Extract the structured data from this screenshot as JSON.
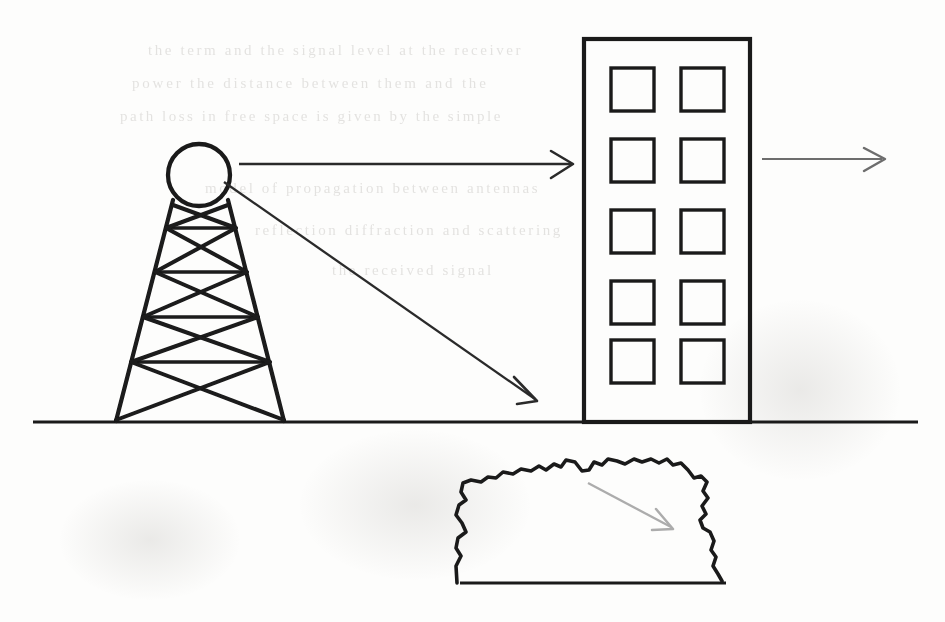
{
  "figure": {
    "kind": "line-diagram",
    "background_color": "#fdfdfc",
    "ink_color": "#1a1a1a",
    "faint_ink_color": "#9d9d9d",
    "ghost_text_color": "#cfcdca"
  },
  "ground": {
    "label": "ground-line",
    "x1": 33,
    "y1": 422,
    "x2": 918,
    "y2": 422,
    "stroke_width": 3.2
  },
  "tower": {
    "label": "transmitter-tower",
    "base_left_x": 115,
    "base_right_x": 285,
    "top_left_x": 173,
    "top_right_x": 228,
    "top_y": 203,
    "base_y": 421,
    "stroke_width": 4.0,
    "bracing_levels": 5,
    "antenna": {
      "label": "antenna-dish",
      "shape": "circle",
      "cx": 199,
      "cy": 175,
      "r": 31,
      "stroke_width": 4.2
    }
  },
  "building": {
    "label": "receiver-building",
    "x": 584,
    "y": 39,
    "width": 166,
    "height": 383,
    "stroke_width": 4.0,
    "window_rows": 5,
    "window_cols": 2,
    "window_size": 43,
    "window_stroke_width": 3.4,
    "window_col_x": [
      611,
      681
    ],
    "window_row_y": [
      68,
      139,
      210,
      281,
      340
    ]
  },
  "arrows": [
    {
      "name": "direct-path-arrow",
      "description": "horizontal ray from antenna to building",
      "x1": 239,
      "y1": 164,
      "x2": 573,
      "y2": 164,
      "color": "#2a2a2a",
      "stroke_width": 2.2,
      "head": "open-v"
    },
    {
      "name": "reflected-path-arrow",
      "description": "diagonal ray from antenna down to ground",
      "x1": 225,
      "y1": 183,
      "x2": 537,
      "y2": 401,
      "color": "#2a2a2a",
      "stroke_width": 2.2,
      "head": "open-v"
    },
    {
      "name": "transmitted-path-arrow",
      "description": "short ray continuing past the building",
      "x1": 762,
      "y1": 159,
      "x2": 886,
      "y2": 159,
      "color": "#6d6d6d",
      "stroke_width": 2.0,
      "head": "open-v"
    },
    {
      "name": "terrain-scatter-arrow",
      "description": "faint grey ray inside the terrain obstacle",
      "x1": 588,
      "y1": 483,
      "x2": 674,
      "y2": 529,
      "color": "#a9a9a9",
      "stroke_width": 2.2,
      "head": "open-v"
    }
  ],
  "terrain": {
    "label": "terrain-obstacle",
    "description": "rough irregular hill outline with flat base",
    "left_x": 455,
    "right_x": 726,
    "base_y": 583,
    "peak_y": 459,
    "stroke_width": 3.6
  },
  "ghost_text": {
    "description": "faint bleed-through text from the reverse side of the scanned page",
    "lines": [
      {
        "text": "the  term  and  the  signal  level  at  the  receiver",
        "x": 148,
        "y": 42,
        "size": 15,
        "spacing": 2.6
      },
      {
        "text": "power  the  distance  between  them  and  the",
        "x": 132,
        "y": 75,
        "size": 15,
        "spacing": 2.8
      },
      {
        "text": "path  loss  in  free  space  is  given  by  the  simple",
        "x": 120,
        "y": 108,
        "size": 15,
        "spacing": 2.5
      },
      {
        "text": "model  of  propagation  between  antennas",
        "x": 205,
        "y": 180,
        "size": 15,
        "spacing": 2.6
      },
      {
        "text": "reflection  diffraction  and  scattering",
        "x": 255,
        "y": 222,
        "size": 15,
        "spacing": 2.6
      },
      {
        "text": "the  received  signal",
        "x": 332,
        "y": 262,
        "size": 15,
        "spacing": 2.6
      }
    ]
  },
  "smudges": [
    {
      "x": 300,
      "y": 430,
      "w": 230,
      "h": 150
    },
    {
      "x": 700,
      "y": 300,
      "w": 200,
      "h": 180
    },
    {
      "x": 60,
      "y": 480,
      "w": 180,
      "h": 120
    }
  ]
}
